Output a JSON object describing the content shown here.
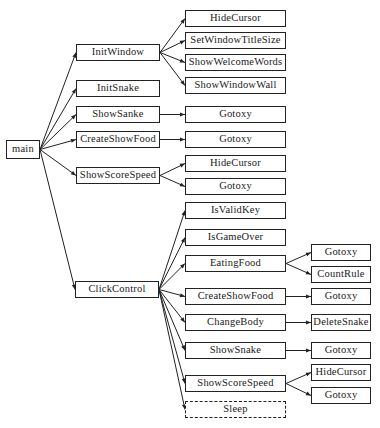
{
  "diagram": {
    "type": "call-tree",
    "root": {
      "id": "main",
      "label": "main"
    },
    "nodes": [
      {
        "id": "main",
        "label": "main",
        "x": 6,
        "y": 140,
        "w": 34,
        "h": 19
      },
      {
        "id": "InitWindow",
        "label": "InitWindow",
        "x": 76,
        "y": 44,
        "w": 84,
        "h": 17
      },
      {
        "id": "InitSnake",
        "label": "InitSnake",
        "x": 76,
        "y": 80,
        "w": 84,
        "h": 17
      },
      {
        "id": "ShowSanke",
        "label": "ShowSanke",
        "x": 76,
        "y": 106,
        "w": 84,
        "h": 17
      },
      {
        "id": "CreateShowFood1",
        "label": "CreateShowFood",
        "x": 76,
        "y": 131,
        "w": 84,
        "h": 17
      },
      {
        "id": "ShowScoreSpeed1",
        "label": "ShowScoreSpeed",
        "x": 76,
        "y": 167,
        "w": 84,
        "h": 17
      },
      {
        "id": "ClickControl",
        "label": "ClickControl",
        "x": 75,
        "y": 281,
        "w": 84,
        "h": 17
      },
      {
        "id": "HideCursor1",
        "label": "HideCursor",
        "x": 185,
        "y": 10,
        "w": 101,
        "h": 17
      },
      {
        "id": "SetWindowTitleSize",
        "label": "SetWindowTitleSize",
        "x": 185,
        "y": 32,
        "w": 101,
        "h": 17
      },
      {
        "id": "ShowWelcomeWords",
        "label": "ShowWelcomeWords",
        "x": 185,
        "y": 54,
        "w": 101,
        "h": 17
      },
      {
        "id": "ShowWindowWall",
        "label": "ShowWindowWall",
        "x": 185,
        "y": 77,
        "w": 101,
        "h": 17
      },
      {
        "id": "Gotoxy1",
        "label": "Gotoxy",
        "x": 185,
        "y": 106,
        "w": 101,
        "h": 17
      },
      {
        "id": "Gotoxy2",
        "label": "Gotoxy",
        "x": 185,
        "y": 131,
        "w": 101,
        "h": 17
      },
      {
        "id": "HideCursor2",
        "label": "HideCursor",
        "x": 185,
        "y": 155,
        "w": 101,
        "h": 17
      },
      {
        "id": "Gotoxy3",
        "label": "Gotoxy",
        "x": 185,
        "y": 178,
        "w": 101,
        "h": 17
      },
      {
        "id": "IsValidKey",
        "label": "IsValidKey",
        "x": 185,
        "y": 202,
        "w": 101,
        "h": 17
      },
      {
        "id": "IsGameOver",
        "label": "IsGameOver",
        "x": 185,
        "y": 229,
        "w": 101,
        "h": 17
      },
      {
        "id": "EatingFood",
        "label": "EatingFood",
        "x": 185,
        "y": 255,
        "w": 101,
        "h": 17
      },
      {
        "id": "CreateShowFood2",
        "label": "CreateShowFood",
        "x": 185,
        "y": 288,
        "w": 101,
        "h": 17
      },
      {
        "id": "ChangeBody",
        "label": "ChangeBody",
        "x": 185,
        "y": 314,
        "w": 101,
        "h": 17
      },
      {
        "id": "ShowSnake",
        "label": "ShowSnake",
        "x": 185,
        "y": 342,
        "w": 101,
        "h": 17
      },
      {
        "id": "ShowScoreSpeed2",
        "label": "ShowScoreSpeed",
        "x": 185,
        "y": 375,
        "w": 101,
        "h": 17
      },
      {
        "id": "Sleep",
        "label": "Sleep",
        "x": 185,
        "y": 401,
        "w": 101,
        "h": 17,
        "dashed": true
      },
      {
        "id": "Gotoxy4",
        "label": "Gotoxy",
        "x": 311,
        "y": 244,
        "w": 60,
        "h": 17
      },
      {
        "id": "CountRule",
        "label": "CountRule",
        "x": 311,
        "y": 266,
        "w": 60,
        "h": 17
      },
      {
        "id": "Gotoxy5",
        "label": "Gotoxy",
        "x": 311,
        "y": 288,
        "w": 60,
        "h": 17
      },
      {
        "id": "DeleteSnake",
        "label": "DeleteSnake",
        "x": 311,
        "y": 314,
        "w": 60,
        "h": 17
      },
      {
        "id": "Gotoxy6",
        "label": "Gotoxy",
        "x": 311,
        "y": 342,
        "w": 60,
        "h": 17
      },
      {
        "id": "HideCursor3",
        "label": "HideCursor",
        "x": 311,
        "y": 364,
        "w": 60,
        "h": 17
      },
      {
        "id": "Gotoxy7",
        "label": "Gotoxy",
        "x": 311,
        "y": 387,
        "w": 60,
        "h": 17
      }
    ],
    "edges": [
      [
        "main",
        "InitWindow"
      ],
      [
        "main",
        "InitSnake"
      ],
      [
        "main",
        "ShowSanke"
      ],
      [
        "main",
        "CreateShowFood1"
      ],
      [
        "main",
        "ShowScoreSpeed1"
      ],
      [
        "main",
        "ClickControl"
      ],
      [
        "InitWindow",
        "HideCursor1"
      ],
      [
        "InitWindow",
        "SetWindowTitleSize"
      ],
      [
        "InitWindow",
        "ShowWelcomeWords"
      ],
      [
        "InitWindow",
        "ShowWindowWall"
      ],
      [
        "ShowSanke",
        "Gotoxy1"
      ],
      [
        "CreateShowFood1",
        "Gotoxy2"
      ],
      [
        "ShowScoreSpeed1",
        "HideCursor2"
      ],
      [
        "ShowScoreSpeed1",
        "Gotoxy3"
      ],
      [
        "ClickControl",
        "IsValidKey"
      ],
      [
        "ClickControl",
        "IsGameOver"
      ],
      [
        "ClickControl",
        "EatingFood"
      ],
      [
        "ClickControl",
        "CreateShowFood2"
      ],
      [
        "ClickControl",
        "ChangeBody"
      ],
      [
        "ClickControl",
        "ShowSnake"
      ],
      [
        "ClickControl",
        "ShowScoreSpeed2"
      ],
      [
        "ClickControl",
        "Sleep"
      ],
      [
        "EatingFood",
        "Gotoxy4"
      ],
      [
        "EatingFood",
        "CountRule"
      ],
      [
        "CreateShowFood2",
        "Gotoxy5"
      ],
      [
        "ChangeBody",
        "DeleteSnake"
      ],
      [
        "ShowSnake",
        "Gotoxy6"
      ],
      [
        "ShowScoreSpeed2",
        "HideCursor3"
      ],
      [
        "ShowScoreSpeed2",
        "Gotoxy7"
      ]
    ],
    "colors": {
      "line": "#222222",
      "box_border": "#222222",
      "background": "#ffffff"
    }
  }
}
